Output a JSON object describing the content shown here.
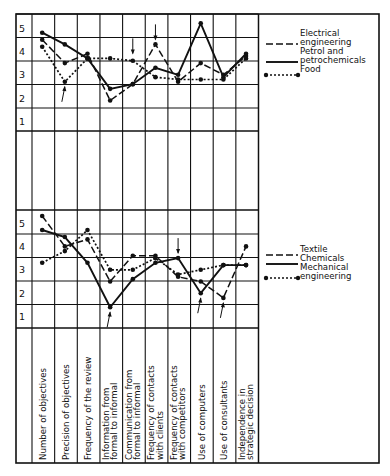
{
  "chart_data": [
    {
      "type": "line",
      "panel": "top",
      "title": "",
      "xlabel": "",
      "ylabel": "",
      "ylim": [
        0.5,
        5.5
      ],
      "yticks": [
        1,
        2,
        3,
        4,
        5
      ],
      "grid": true,
      "legend_position": "right",
      "categories": [
        "Number of objectives",
        "Precision of objectives",
        "Frequency of the review",
        "Information from formal to informal",
        "Communication from formal to informal",
        "Frequency of contacts with clients",
        "Frequency of contacts with competitors",
        "Use of computers",
        "Use of consultants",
        "Independence in strategic decision"
      ],
      "series": [
        {
          "name": "Electrical engineering",
          "style": "dashed",
          "values": [
            4.5,
            3.5,
            3.9,
            1.9,
            2.6,
            4.3,
            2.7,
            3.5,
            3.0,
            3.8
          ]
        },
        {
          "name": "Petrol and petrochemicals",
          "style": "solid",
          "values": [
            4.8,
            4.3,
            3.7,
            2.4,
            2.6,
            3.3,
            3.0,
            5.2,
            2.9,
            3.9
          ]
        },
        {
          "name": "Food",
          "style": "dotted",
          "values": [
            4.2,
            2.7,
            3.7,
            3.7,
            3.6,
            2.9,
            2.8,
            2.8,
            2.8,
            3.7
          ]
        }
      ],
      "arrows": [
        {
          "category_index": 1,
          "direction": "up",
          "value": 2.7
        },
        {
          "category_index": 4,
          "direction": "down",
          "value": 3.7
        },
        {
          "category_index": 5,
          "direction": "down",
          "value": 4.3
        }
      ]
    },
    {
      "type": "line",
      "panel": "bottom",
      "title": "",
      "xlabel": "",
      "ylabel": "",
      "ylim": [
        0.5,
        5.5
      ],
      "yticks": [
        1,
        2,
        3,
        4,
        5
      ],
      "grid": true,
      "legend_position": "right",
      "categories": [
        "Number of objectives",
        "Precision of objectives",
        "Frequency of the review",
        "Information from formal to informal",
        "Communication from formal to informal",
        "Frequency of contacts with clients",
        "Frequency of contacts with competitors",
        "Use of computers",
        "Use of consultants",
        "Independence in strategic decision"
      ],
      "series": [
        {
          "name": "Textile",
          "style": "dashed",
          "values": [
            5.3,
            4.0,
            4.3,
            2.5,
            3.6,
            3.6,
            2.7,
            2.5,
            1.8,
            4.0
          ]
        },
        {
          "name": "Chemicals",
          "style": "solid",
          "values": [
            4.7,
            4.4,
            3.3,
            1.4,
            2.6,
            3.3,
            3.5,
            2.0,
            3.2,
            3.2
          ]
        },
        {
          "name": "Mechanical engineering",
          "style": "dotted",
          "values": [
            3.3,
            3.8,
            4.7,
            3.0,
            3.0,
            3.5,
            2.8,
            3.0,
            3.2,
            3.2
          ]
        }
      ],
      "arrows": [
        {
          "category_index": 3,
          "direction": "up",
          "value": 1.4
        },
        {
          "category_index": 6,
          "direction": "down",
          "value": 3.5
        },
        {
          "category_index": 7,
          "direction": "up",
          "value": 2.0
        },
        {
          "category_index": 8,
          "direction": "up",
          "value": 1.8
        }
      ]
    }
  ],
  "legend_top": [
    {
      "lines": [
        "Electrical",
        "engineering"
      ],
      "style": "dashed"
    },
    {
      "lines": [
        "Petrol and",
        "petrochemicals"
      ],
      "style": "solid"
    },
    {
      "lines": [
        "Food"
      ],
      "style": "dotted"
    }
  ],
  "legend_bottom": [
    {
      "lines": [
        "Textile"
      ],
      "style": "dashed"
    },
    {
      "lines": [
        "Chemicals"
      ],
      "style": "solid"
    },
    {
      "lines": [
        "Mechanical",
        "engineering"
      ],
      "style": "dotted"
    }
  ],
  "category_labels": [
    [
      "Number of objectives"
    ],
    [
      "Precision of objectives"
    ],
    [
      "Frequency of the review"
    ],
    [
      "Information from",
      "formal to informal"
    ],
    [
      "Communication from",
      "formal to informal"
    ],
    [
      "Frequency of contacts",
      "with clients"
    ],
    [
      "Frequency of contacts",
      "with competitors"
    ],
    [
      "Use of computers"
    ],
    [
      "Use of consultants"
    ],
    [
      "Independence in",
      "strategic decision"
    ]
  ],
  "y_tick_labels": [
    "5",
    "4",
    "3",
    "2",
    "1"
  ],
  "colors": {
    "ink": "#111111",
    "background": "#ffffff"
  }
}
